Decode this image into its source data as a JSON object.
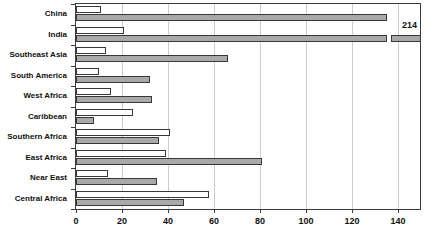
{
  "chart_data": {
    "type": "bar",
    "orientation": "horizontal",
    "title": "",
    "xlabel": "",
    "ylabel": "",
    "categories": [
      "China",
      "India",
      "Southeast Asia",
      "South America",
      "West Africa",
      "Caribbean",
      "Southern Africa",
      "East Africa",
      "Near East",
      "Central Africa"
    ],
    "series": [
      {
        "name": "white",
        "color": "#fdfdfd",
        "values": [
          11,
          21,
          13,
          10,
          15,
          25,
          41,
          39,
          14,
          58
        ]
      },
      {
        "name": "gray",
        "color": "#a9a9a9",
        "values": [
          135,
          214,
          66,
          32,
          33,
          8,
          36,
          81,
          35,
          47
        ]
      }
    ],
    "xlim": [
      0,
      140
    ],
    "x_ticks": [
      0,
      20,
      40,
      60,
      80,
      100,
      120,
      140
    ],
    "grid": true,
    "legend": false,
    "annotations": [
      {
        "text": "214",
        "category": "India",
        "series": "gray",
        "axis_break": true
      }
    ]
  },
  "colors": {
    "bar_gray": "#a9a9a9",
    "bar_white": "#fdfdfd",
    "bar_border": "#383838",
    "gridline": "#cccccc",
    "plot_border": "#3c3c3c",
    "text": "#111111"
  }
}
